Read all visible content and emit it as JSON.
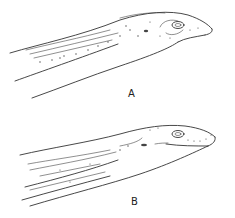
{
  "figure": {
    "panels": [
      {
        "id": "A",
        "label": "A",
        "subject": "lateral view of head (eel-like)"
      },
      {
        "id": "B",
        "label": "B",
        "subject": "lateral view of head (eel-like)"
      }
    ],
    "line_color": "#333333",
    "background": "#ffffff"
  }
}
